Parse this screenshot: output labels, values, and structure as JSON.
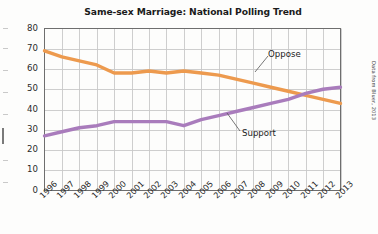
{
  "figure": {
    "title": "Same-sex Marriage: National Polling Trend",
    "source_note": "Data from Bluer, 2013"
  },
  "annotations": [
    {
      "name": "oppose-label",
      "text": "Oppose"
    },
    {
      "name": "support-label",
      "text": "Support"
    }
  ],
  "colors": {
    "oppose": "#ED9A4E",
    "support": "#A97CBC",
    "grid": "#c8c8c8",
    "axis": "#6e6e6e",
    "text": "#1b1b1b",
    "background": "#fdfdfc"
  },
  "chart_data": {
    "type": "line",
    "title": "Same-sex Marriage: National Polling Trend",
    "xlabel": "",
    "ylabel": "",
    "ylim": [
      0,
      80
    ],
    "ytick_values": [
      0,
      10,
      20,
      30,
      40,
      50,
      60,
      70,
      80
    ],
    "grid": true,
    "legend": "annotated-inline",
    "categories": [
      "1996",
      "1997",
      "1998",
      "1999",
      "2000",
      "2001",
      "2002",
      "2003",
      "2004",
      "2005",
      "2006",
      "2007",
      "2008",
      "2009",
      "2010",
      "2011",
      "2012",
      "2013"
    ],
    "series": [
      {
        "name": "Oppose",
        "color": "#ED9A4E",
        "values": [
          69,
          66,
          64,
          62,
          58,
          58,
          59,
          58,
          59,
          58,
          57,
          55,
          53,
          51,
          49,
          47,
          45,
          43
        ]
      },
      {
        "name": "Support",
        "color": "#A97CBC",
        "values": [
          27,
          29,
          31,
          32,
          34,
          34,
          34,
          34,
          32,
          35,
          37,
          39,
          41,
          43,
          45,
          48,
          50,
          51
        ]
      }
    ]
  }
}
